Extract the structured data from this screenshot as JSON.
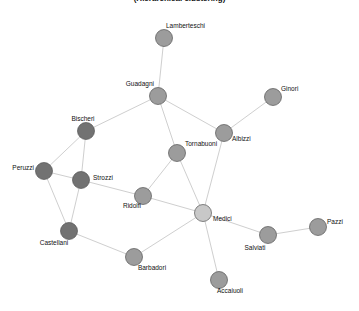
{
  "title": "(Hierarchical clustering)",
  "colors": {
    "background": "#ffffff",
    "edge": "#cfcfcf",
    "node_stroke": "#555555",
    "cluster_dark": "#727272",
    "cluster_medium": "#9c9c9c",
    "cluster_light": "#c8c8c8"
  },
  "nodes": [
    {
      "id": "Lamberteschi",
      "label": "Lamberteschi",
      "x": 164,
      "y": 38,
      "cluster": "medium",
      "lx": 166,
      "ly": 28,
      "anchor": "start"
    },
    {
      "id": "Guadagni",
      "label": "Guadagni",
      "x": 158,
      "y": 96,
      "cluster": "medium",
      "lx": 154,
      "ly": 86,
      "anchor": "end"
    },
    {
      "id": "Ginori",
      "label": "Ginori",
      "x": 273,
      "y": 97,
      "cluster": "medium",
      "lx": 281,
      "ly": 91,
      "anchor": "start"
    },
    {
      "id": "Bischeri",
      "label": "Bischeri",
      "x": 86,
      "y": 131,
      "cluster": "dark",
      "lx": 83,
      "ly": 121,
      "anchor": "middle"
    },
    {
      "id": "Albizzi",
      "label": "Albizzi",
      "x": 224,
      "y": 133,
      "cluster": "medium",
      "lx": 232,
      "ly": 141,
      "anchor": "start"
    },
    {
      "id": "Tornabuoni",
      "label": "Tornabuoni",
      "x": 177,
      "y": 153,
      "cluster": "medium",
      "lx": 185,
      "ly": 146,
      "anchor": "start"
    },
    {
      "id": "Peruzzi",
      "label": "Peruzzi",
      "x": 44,
      "y": 171,
      "cluster": "dark",
      "lx": 34,
      "ly": 170,
      "anchor": "end"
    },
    {
      "id": "Strozzi",
      "label": "Strozzi",
      "x": 81,
      "y": 180,
      "cluster": "dark",
      "lx": 93,
      "ly": 180,
      "anchor": "start"
    },
    {
      "id": "Ridolfi",
      "label": "Ridolfi",
      "x": 143,
      "y": 196,
      "cluster": "medium",
      "lx": 132,
      "ly": 208,
      "anchor": "middle"
    },
    {
      "id": "Medici",
      "label": "Medici",
      "x": 203,
      "y": 213,
      "cluster": "light",
      "lx": 213,
      "ly": 221,
      "anchor": "start"
    },
    {
      "id": "Pazzi",
      "label": "Pazzi",
      "x": 318,
      "y": 227,
      "cluster": "medium",
      "lx": 327,
      "ly": 224,
      "anchor": "start"
    },
    {
      "id": "Castellani",
      "label": "Castellani",
      "x": 69,
      "y": 231,
      "cluster": "dark",
      "lx": 54,
      "ly": 245,
      "anchor": "middle"
    },
    {
      "id": "Salviati",
      "label": "Salviati",
      "x": 268,
      "y": 235,
      "cluster": "medium",
      "lx": 255,
      "ly": 250,
      "anchor": "middle"
    },
    {
      "id": "Barbadori",
      "label": "Barbadori",
      "x": 134,
      "y": 257,
      "cluster": "medium",
      "lx": 152,
      "ly": 270,
      "anchor": "middle"
    },
    {
      "id": "Accaiuoli",
      "label": "Accaiuoli",
      "x": 219,
      "y": 280,
      "cluster": "medium",
      "lx": 230,
      "ly": 293,
      "anchor": "middle"
    }
  ],
  "edges": [
    [
      "Lamberteschi",
      "Guadagni"
    ],
    [
      "Guadagni",
      "Bischeri"
    ],
    [
      "Guadagni",
      "Tornabuoni"
    ],
    [
      "Guadagni",
      "Albizzi"
    ],
    [
      "Bischeri",
      "Peruzzi"
    ],
    [
      "Bischeri",
      "Strozzi"
    ],
    [
      "Peruzzi",
      "Strozzi"
    ],
    [
      "Peruzzi",
      "Castellani"
    ],
    [
      "Strozzi",
      "Castellani"
    ],
    [
      "Strozzi",
      "Ridolfi"
    ],
    [
      "Castellani",
      "Barbadori"
    ],
    [
      "Barbadori",
      "Medici"
    ],
    [
      "Ridolfi",
      "Medici"
    ],
    [
      "Ridolfi",
      "Tornabuoni"
    ],
    [
      "Tornabuoni",
      "Medici"
    ],
    [
      "Albizzi",
      "Medici"
    ],
    [
      "Albizzi",
      "Ginori"
    ],
    [
      "Medici",
      "Salviati"
    ],
    [
      "Medici",
      "Accaiuoli"
    ],
    [
      "Salviati",
      "Pazzi"
    ]
  ]
}
